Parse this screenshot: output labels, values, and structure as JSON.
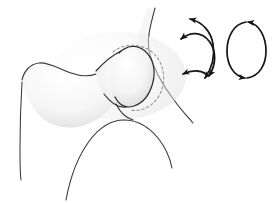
{
  "figure": {
    "title": "Hip joint range of motion diagram",
    "caption": "",
    "width": 274,
    "height": 203,
    "background_color": "#ffffff"
  },
  "style": {
    "outline_color": "#3a3a3a",
    "outline_color_dark": "#2b2b2b",
    "arrow_color": "#141414",
    "dashed_outline_color": "#9a9a9a",
    "bone_fill_light": "#fbfbfb",
    "bone_fill_mid": "#f0f0f0",
    "bone_fill_shadow": "#dcdcdc",
    "outline_width": 1.1,
    "arrow_width": 1.7,
    "dash_pattern": "2.4 2.6"
  },
  "anatomy": {
    "parts": [
      {
        "id": "pelvis-ilium",
        "label": "Pelvis / ilium",
        "shaded": true
      },
      {
        "id": "acetabulum-dashed-outline",
        "label": "Acetabulum (hidden femoral head outline)",
        "shape": "dashed-circle",
        "center_x": 140,
        "center_y": 72,
        "radius": 27,
        "shaded": false
      },
      {
        "id": "femoral-head",
        "label": "Femoral head",
        "shaded": true
      },
      {
        "id": "femoral-neck",
        "label": "Femoral neck",
        "shaded": true
      },
      {
        "id": "greater-trochanter",
        "label": "Greater trochanter",
        "shaded": true
      },
      {
        "id": "femoral-shaft",
        "label": "Femoral shaft",
        "shaded": false
      },
      {
        "id": "ischium-pubis",
        "label": "Ischium / inferior pelvis ramus",
        "shaded": false
      }
    ]
  },
  "motion_indicators": [
    {
      "id": "arrow-flexion-extension-upper",
      "label": "Flexion / extension arc (upper)",
      "type": "double-headed-curved-arrow",
      "orientation": "concave-left",
      "arrowheads": 2
    },
    {
      "id": "arrow-flexion-extension-lower",
      "label": "Abduction / adduction arc (lower)",
      "type": "double-headed-curved-arrow",
      "orientation": "concave-right",
      "arrowheads": 2
    },
    {
      "id": "arrow-circumduction-loop",
      "label": "Circumduction / rotation loop",
      "type": "ellipse-loop-arrow",
      "arrowheads": 2,
      "center_x": 247,
      "center_y": 50,
      "radius_x": 20,
      "radius_y": 30
    }
  ]
}
